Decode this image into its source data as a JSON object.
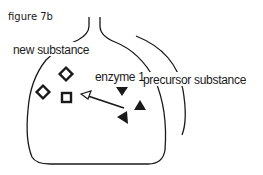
{
  "figure": {
    "title": "figure 7b",
    "labels": {
      "new_substance": "new  substance",
      "enzyme": "enzyme 1",
      "precursor_substance": "precursor  substance"
    },
    "items": {
      "new_substance_shapes": [
        "diamond",
        "diamond",
        "square"
      ],
      "enzyme_shapes": [
        "triangle-down",
        "triangle-up",
        "triangle-left"
      ],
      "arrow": "precursor to new substance"
    },
    "colors": {
      "stroke": "#1a1a1a",
      "background": "#ffffff"
    }
  }
}
